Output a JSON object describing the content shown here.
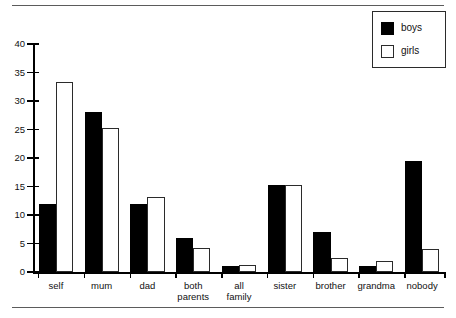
{
  "chart_data": {
    "type": "bar",
    "title": "",
    "xlabel": "",
    "ylabel": "",
    "ylim": [
      0,
      40
    ],
    "yticks": [
      0,
      5,
      10,
      15,
      20,
      25,
      30,
      35,
      40
    ],
    "grid": false,
    "legend_position": "top-right",
    "categories": [
      "self",
      "mum",
      "dad",
      "both\nparents",
      "all\nfamily",
      "sister",
      "brother",
      "grandma",
      "nobody"
    ],
    "series": [
      {
        "name": "boys",
        "color": "#000000",
        "values": [
          11.9,
          28.0,
          11.9,
          6.0,
          1.0,
          15.3,
          7.0,
          1.0,
          19.5
        ]
      },
      {
        "name": "girls",
        "color": "#ffffff",
        "values": [
          33.3,
          25.3,
          13.2,
          4.2,
          1.2,
          15.3,
          2.5,
          2.0,
          4.0
        ]
      }
    ]
  },
  "legend": {
    "entries": [
      {
        "label": "boys",
        "swatch": "filled-black-square"
      },
      {
        "label": "girls",
        "swatch": "outlined-white-square"
      }
    ]
  },
  "axis": {
    "y_tick_labels": [
      "0",
      "5",
      "10",
      "15",
      "20",
      "25",
      "30",
      "35",
      "40"
    ]
  }
}
